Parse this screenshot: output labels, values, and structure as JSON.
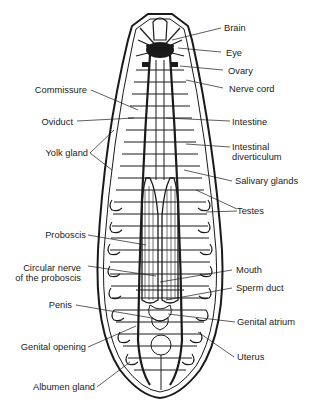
{
  "diagram": {
    "labels_right": [
      {
        "id": "brain",
        "text": "Brain"
      },
      {
        "id": "eye",
        "text": "Eye"
      },
      {
        "id": "ovary",
        "text": "Ovary"
      },
      {
        "id": "nerve_cord",
        "text": "Nerve cord"
      },
      {
        "id": "intestine",
        "text": "Intestine"
      },
      {
        "id": "intestinal_diverticulum_1",
        "text": "Intestinal"
      },
      {
        "id": "intestinal_diverticulum_2",
        "text": "diverticulum"
      },
      {
        "id": "salivary_glands",
        "text": "Salivary glands"
      },
      {
        "id": "testes",
        "text": "Testes"
      },
      {
        "id": "mouth",
        "text": "Mouth"
      },
      {
        "id": "sperm_duct",
        "text": "Sperm duct"
      },
      {
        "id": "genital_atrium",
        "text": "Genital atrium"
      },
      {
        "id": "uterus",
        "text": "Uterus"
      }
    ],
    "labels_left": [
      {
        "id": "commissure",
        "text": "Commissure"
      },
      {
        "id": "oviduct",
        "text": "Oviduct"
      },
      {
        "id": "yolk_gland",
        "text": "Yolk gland"
      },
      {
        "id": "proboscis",
        "text": "Proboscis"
      },
      {
        "id": "circular_nerve_1",
        "text": "Circular nerve"
      },
      {
        "id": "circular_nerve_2",
        "text": "of the proboscis"
      },
      {
        "id": "penis",
        "text": "Penis"
      },
      {
        "id": "genital_opening",
        "text": "Genital opening"
      },
      {
        "id": "albumen_gland",
        "text": "Albumen gland"
      }
    ],
    "colors": {
      "ink": "#1a1a1a",
      "background": "#ffffff"
    }
  }
}
